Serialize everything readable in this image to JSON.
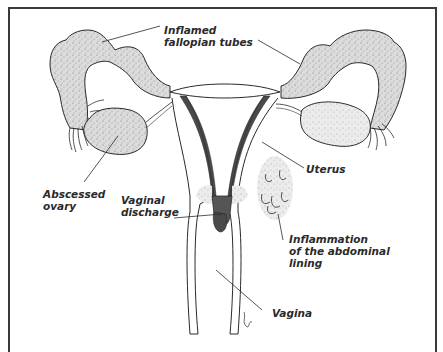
{
  "diagram": {
    "colors": {
      "outline": "#2a2a2a",
      "stipple_fill": "#d9d9d9",
      "dark_lining": "#555555",
      "frame": "#3a3a3a",
      "background": "#ffffff"
    },
    "labels": {
      "fallopian": {
        "line1": "Inflamed",
        "line2": "fallopian tubes"
      },
      "uterus": {
        "line1": "Uterus"
      },
      "ovary": {
        "line1": "Abscessed",
        "line2": "ovary"
      },
      "discharge": {
        "line1": "Vaginal",
        "line2": "discharge"
      },
      "abdominal": {
        "line1": "Inflammation",
        "line2": "of the abdominal",
        "line3": "lining"
      },
      "vagina": {
        "line1": "Vagina"
      }
    }
  }
}
